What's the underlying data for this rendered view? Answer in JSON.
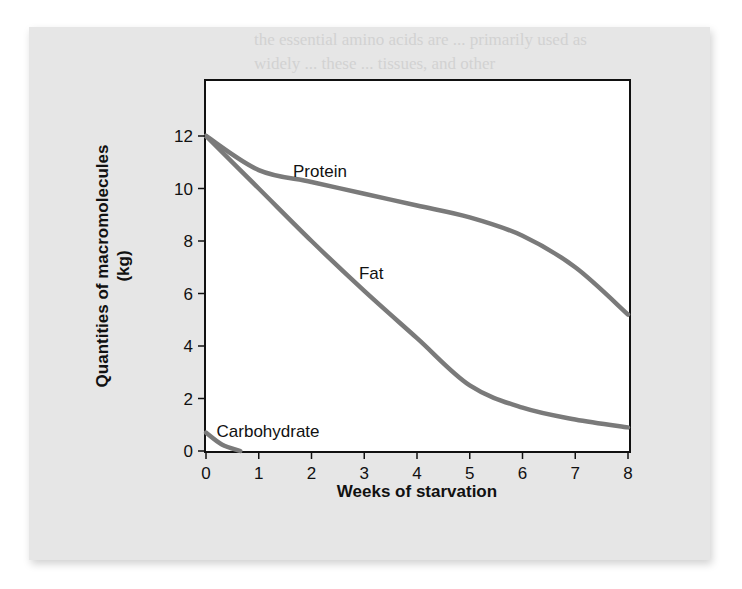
{
  "chart_data": {
    "type": "line",
    "title": "",
    "xlabel": "Weeks of starvation",
    "ylabel": "Quantities of macromolecules",
    "ylabel_unit": "(kg)",
    "xlim": [
      0,
      8
    ],
    "ylim": [
      0,
      12
    ],
    "x_ticks": [
      0,
      1,
      2,
      3,
      4,
      5,
      6,
      7,
      8
    ],
    "y_ticks": [
      0,
      2,
      4,
      6,
      8,
      10,
      12
    ],
    "grid": false,
    "legend": "inline labels",
    "series": [
      {
        "name": "Protein",
        "color": "#7a7a7a",
        "x": [
          0,
          1,
          2,
          3,
          4,
          5,
          6,
          7,
          8
        ],
        "values": [
          12,
          10.7,
          10.25,
          9.8,
          9.35,
          8.9,
          8.2,
          7.0,
          5.2
        ],
        "label_pos": [
          1.65,
          10.45
        ]
      },
      {
        "name": "Fat",
        "color": "#7a7a7a",
        "x": [
          0,
          1,
          2,
          3,
          4,
          5,
          6,
          7,
          8
        ],
        "values": [
          12,
          10.0,
          8.0,
          6.1,
          4.3,
          2.5,
          1.65,
          1.2,
          0.9
        ],
        "label_pos": [
          2.9,
          6.55
        ]
      },
      {
        "name": "Carbohydrate",
        "color": "#7a7a7a",
        "x": [
          0,
          0.3,
          0.65
        ],
        "values": [
          0.7,
          0.25,
          0
        ],
        "label_pos": [
          0.2,
          0.55
        ]
      }
    ]
  },
  "page_bleed_text": [
    "the essential amino acids are ... primarily used as",
    "widely ... these ... tissues, and other"
  ]
}
